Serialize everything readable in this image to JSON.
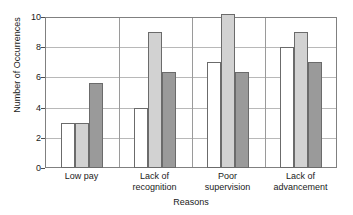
{
  "chart_data": {
    "type": "bar",
    "title": "",
    "xlabel": "Reasons",
    "ylabel": "Number of Occurrences",
    "categories": [
      "Low pay",
      "Lack of recognition",
      "Poor supervision",
      "Lack of advancement"
    ],
    "category_lines": [
      [
        "Low pay"
      ],
      [
        "Lack of",
        "recognition"
      ],
      [
        "Poor",
        "supervision"
      ],
      [
        "Lack of",
        "advancement"
      ]
    ],
    "series": [
      {
        "name": "series-1",
        "color": "#ffffff",
        "values": [
          3,
          4,
          7,
          8
        ]
      },
      {
        "name": "series-2",
        "color": "#d2d2d2",
        "values": [
          3,
          9,
          10.2,
          9
        ]
      },
      {
        "name": "series-3",
        "color": "#9a9a9a",
        "values": [
          5.6,
          6.35,
          6.35,
          7
        ]
      }
    ],
    "ylim": [
      0,
      10
    ],
    "yticks": [
      0,
      2,
      4,
      6,
      8,
      10
    ],
    "ytick_labels": [
      "0",
      "2",
      "4",
      "6",
      "8",
      "10"
    ],
    "grid": true,
    "gridlines_at": [
      2,
      4,
      6,
      8,
      10
    ],
    "legend": "none",
    "bar_border_color": "#6b6b6b",
    "axis_color": "#808080",
    "grid_color": "#b8b8b8",
    "text_color": "#1a1a1a"
  }
}
